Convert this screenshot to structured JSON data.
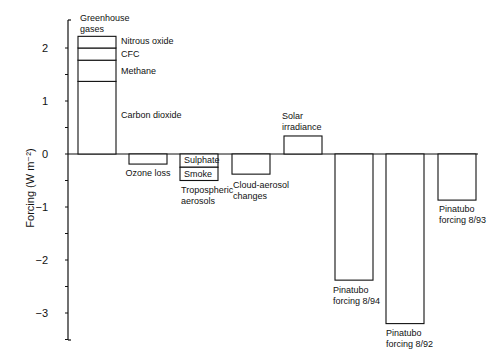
{
  "chart_data": {
    "type": "bar",
    "title": "",
    "xlabel": "",
    "ylabel": "Forcing (W m⁻²)",
    "ylim": [
      -3.5,
      2.4
    ],
    "yticks": [
      2,
      1,
      0,
      -1,
      -2,
      -3
    ],
    "ytick_labels": [
      "2",
      "1",
      "0",
      "−1",
      "−2",
      "−3"
    ],
    "grid": false,
    "legend": "none",
    "categories": [
      "Greenhouse gases",
      "Ozone loss",
      "Tropospheric aerosols",
      "Cloud-aerosol changes",
      "Solar irradiance",
      "Pinatubo forcing 8/94",
      "Pinatubo forcing 8/92",
      "Pinatubo forcing 8/93"
    ],
    "bars": [
      {
        "category": "Greenhouse gases",
        "label_lines": [
          "Greenhouse",
          "gases"
        ],
        "stacked": true,
        "segments": [
          {
            "name": "Carbon dioxide",
            "value": 1.37
          },
          {
            "name": "Methane",
            "value": 0.4
          },
          {
            "name": "CFC",
            "value": 0.23
          },
          {
            "name": "Nitrous oxide",
            "value": 0.22
          }
        ],
        "total": 2.22
      },
      {
        "category": "Ozone loss",
        "label_lines": [
          "Ozone loss"
        ],
        "value": -0.19
      },
      {
        "category": "Tropospheric aerosols",
        "label_lines": [
          "Tropospheric",
          "aerosols"
        ],
        "stacked": true,
        "segments": [
          {
            "name": "Sulphate",
            "value": -0.25
          },
          {
            "name": "Smoke",
            "value": -0.25
          }
        ],
        "total": -0.5
      },
      {
        "category": "Cloud-aerosol changes",
        "label_lines": [
          "Cloud-aerosol",
          "changes"
        ],
        "value": -0.38
      },
      {
        "category": "Solar irradiance",
        "label_lines": [
          "Solar",
          "irradiance"
        ],
        "value": 0.34
      },
      {
        "category": "Pinatubo forcing 8/94",
        "label_lines": [
          "Pinatubo",
          "forcing 8/94"
        ],
        "value": -2.38
      },
      {
        "category": "Pinatubo forcing 8/92",
        "label_lines": [
          "Pinatubo",
          "forcing 8/92"
        ],
        "value": -3.2
      },
      {
        "category": "Pinatubo forcing 8/93",
        "label_lines": [
          "Pinatubo",
          "forcing 8/93"
        ],
        "value": -0.87
      }
    ]
  }
}
